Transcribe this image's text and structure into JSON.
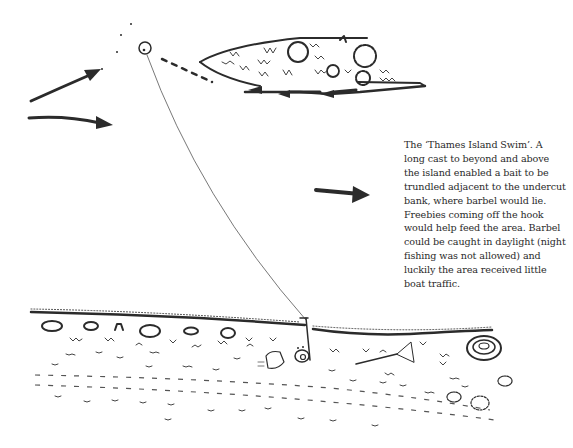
{
  "figure": {
    "caption": "The ‘Thames Island Swim’. A long cast to beyond and above the island enabled a bait to be trundled adjacent to the undercut bank, where barbel would lie. Freebies coming off the hook would help feed the area. Barbel could be caught in daylight (night fishing was not allowed) and luckily the area received little boat traffic.",
    "caption_lines": [
      "The ‘Thames Island Swim’. A",
      "long cast to beyond and above",
      "the island enabled a bait to be",
      "trundled adjacent to the undercut",
      "bank, where barbel would lie.",
      "Freebies coming off the hook",
      "would help feed the area. Barbel",
      "could be caught in daylight (night",
      "fishing was not allowed) and",
      "luckily the area received little",
      "boat traffic."
    ],
    "elements": {
      "island": "island-sketch",
      "current_arrows": [
        "arrow-upper-left",
        "arrow-lower-left",
        "arrow-mid-right"
      ],
      "bait_marker": "cast-target-circle",
      "fishing_line": "fishing-line",
      "rod": "rod-on-bank",
      "reel": "reel-icon",
      "bag": "tackle-bag",
      "landing_net": "landing-net",
      "bush": "bankside-bush"
    },
    "ink_color": "#2b2b2b",
    "background": "#ffffff"
  }
}
